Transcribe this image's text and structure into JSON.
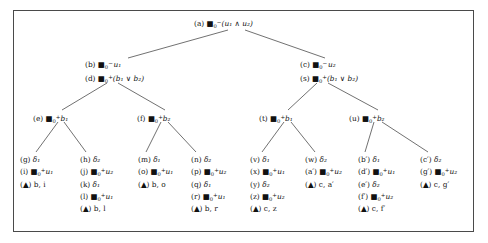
{
  "figure": {
    "type": "proof-tableau-tree",
    "background": "#ffffff",
    "frame_color": "#4a4a4a",
    "text_color": "#111111",
    "width": 488,
    "height": 243
  },
  "symbols": {
    "box_operator": "box-modal-operator",
    "and": "∧",
    "or": "∨",
    "minus": "−",
    "plus": "+",
    "delta": "δ",
    "triangle": "▲",
    "prime": "′"
  },
  "nodes": {
    "a": {
      "id": "root-node-a",
      "lines": [
        {
          "tag": "(a)",
          "op": true,
          "sub": "0",
          "sup": "−",
          "arg": "(u₁ ∧ u₂)"
        }
      ],
      "text": "(a) □₀⁻(u₁ ∧ u₂)"
    },
    "b_d": {
      "id": "node-b-d",
      "lines": [
        {
          "tag": "(b)",
          "op": true,
          "sub": "0",
          "sup": "−",
          "arg": "u₁"
        },
        {
          "tag": "(d)",
          "op": true,
          "sub": "0",
          "sup": "+",
          "arg": "(b₁ ∨ b₂)"
        }
      ],
      "text": "(b) □₀⁻ u₁ / (d) □₀⁺(b₁ ∨ b₂)"
    },
    "c_s": {
      "id": "node-c-s",
      "lines": [
        {
          "tag": "(c)",
          "op": true,
          "sub": "0",
          "sup": "−",
          "arg": "u₂"
        },
        {
          "tag": "(s)",
          "op": true,
          "sub": "0",
          "sup": "+",
          "arg": "(b₁ ∨ b₂)"
        }
      ],
      "text": "(c) □₀⁻ u₂ / (s) □₀⁺(b₁ ∨ b₂)"
    },
    "e": {
      "id": "node-e",
      "lines": [
        {
          "tag": "(e)",
          "op": true,
          "sub": "0",
          "sup": "+",
          "arg": "b₁"
        }
      ],
      "text": "(e) □₀⁺ b₁"
    },
    "f": {
      "id": "node-f",
      "lines": [
        {
          "tag": "(f)",
          "op": true,
          "sub": "0",
          "sup": "+",
          "arg": "b₂"
        }
      ],
      "text": "(f) □₀⁺ b₂"
    },
    "t": {
      "id": "node-t",
      "lines": [
        {
          "tag": "(t)",
          "op": true,
          "sub": "0",
          "sup": "+",
          "arg": "b₁"
        }
      ],
      "text": "(t) □₀⁺ b₁"
    },
    "u": {
      "id": "node-u",
      "lines": [
        {
          "tag": "(u)",
          "op": true,
          "sub": "0",
          "sup": "+",
          "arg": "b₂"
        }
      ],
      "text": "(u) □₀⁺ b₂"
    }
  },
  "leaves": [
    {
      "id": "leaf-g",
      "lines": [
        {
          "tag": "(g)",
          "op": false,
          "delta": "δ₁"
        },
        {
          "tag": "(i)",
          "op": true,
          "sub": "0",
          "sup": "+",
          "arg": "u₁"
        },
        {
          "tag": "(▲)",
          "op": false,
          "closure": "b, i"
        }
      ]
    },
    {
      "id": "leaf-h",
      "lines": [
        {
          "tag": "(h)",
          "op": false,
          "delta": "δ₂"
        },
        {
          "tag": "(j)",
          "op": true,
          "sub": "0",
          "sup": "+",
          "arg": "u₂"
        },
        {
          "tag": "(k)",
          "op": false,
          "delta": "δ₁"
        },
        {
          "tag": "(l)",
          "op": true,
          "sub": "0",
          "sup": "+",
          "arg": "u₁"
        },
        {
          "tag": "(▲)",
          "op": false,
          "closure": "b, l"
        }
      ]
    },
    {
      "id": "leaf-m",
      "lines": [
        {
          "tag": "(m)",
          "op": false,
          "delta": "δ₁"
        },
        {
          "tag": "(o)",
          "op": true,
          "sub": "0",
          "sup": "+",
          "arg": "u₁"
        },
        {
          "tag": "(▲)",
          "op": false,
          "closure": "b, o"
        }
      ]
    },
    {
      "id": "leaf-n",
      "lines": [
        {
          "tag": "(n)",
          "op": false,
          "delta": "δ₂"
        },
        {
          "tag": "(p)",
          "op": true,
          "sub": "0",
          "sup": "+",
          "arg": "u₂"
        },
        {
          "tag": "(q)",
          "op": false,
          "delta": "δ₁"
        },
        {
          "tag": "(r)",
          "op": true,
          "sub": "0",
          "sup": "+",
          "arg": "u₁"
        },
        {
          "tag": "(▲)",
          "op": false,
          "closure": "b, r"
        }
      ]
    },
    {
      "id": "leaf-v",
      "lines": [
        {
          "tag": "(v)",
          "op": false,
          "delta": "δ₁"
        },
        {
          "tag": "(x)",
          "op": true,
          "sub": "0",
          "sup": "+",
          "arg": "u₁"
        },
        {
          "tag": "(y)",
          "op": false,
          "delta": "δ₂"
        },
        {
          "tag": "(z)",
          "op": true,
          "sub": "0",
          "sup": "+",
          "arg": "u₂"
        },
        {
          "tag": "(▲)",
          "op": false,
          "closure": "c, z"
        }
      ]
    },
    {
      "id": "leaf-w",
      "lines": [
        {
          "tag": "(w)",
          "op": false,
          "delta": "δ₂"
        },
        {
          "tag": "(a′)",
          "op": true,
          "sub": "0",
          "sup": "+",
          "arg": "u₂"
        },
        {
          "tag": "(▲)",
          "op": false,
          "closure": "c, a′"
        }
      ]
    },
    {
      "id": "leaf-bprime",
      "lines": [
        {
          "tag": "(b′)",
          "op": false,
          "delta": "δ₁"
        },
        {
          "tag": "(d′)",
          "op": true,
          "sub": "0",
          "sup": "+",
          "arg": "u₁"
        },
        {
          "tag": "(e′)",
          "op": false,
          "delta": "δ₂"
        },
        {
          "tag": "(f′)",
          "op": true,
          "sub": "0",
          "sup": "+",
          "arg": "u₂"
        },
        {
          "tag": "(▲)",
          "op": false,
          "closure": "c, f′"
        }
      ]
    },
    {
      "id": "leaf-cprime",
      "lines": [
        {
          "tag": "(c′)",
          "op": false,
          "delta": "δ₂"
        },
        {
          "tag": "(g′)",
          "op": true,
          "sub": "0",
          "sup": "+",
          "arg": "u₂"
        },
        {
          "tag": "(▲)",
          "op": false,
          "closure": "c, g′"
        }
      ]
    }
  ],
  "edges": [
    {
      "from": "a",
      "to": "b_d"
    },
    {
      "from": "a",
      "to": "c_s"
    },
    {
      "from": "b_d",
      "to": "e"
    },
    {
      "from": "b_d",
      "to": "f"
    },
    {
      "from": "c_s",
      "to": "t"
    },
    {
      "from": "c_s",
      "to": "u"
    },
    {
      "from": "e",
      "to": "leaf-g"
    },
    {
      "from": "e",
      "to": "leaf-h"
    },
    {
      "from": "f",
      "to": "leaf-m"
    },
    {
      "from": "f",
      "to": "leaf-n"
    },
    {
      "from": "t",
      "to": "leaf-v"
    },
    {
      "from": "t",
      "to": "leaf-w"
    },
    {
      "from": "u",
      "to": "leaf-bprime"
    },
    {
      "from": "u",
      "to": "leaf-cprime"
    }
  ]
}
